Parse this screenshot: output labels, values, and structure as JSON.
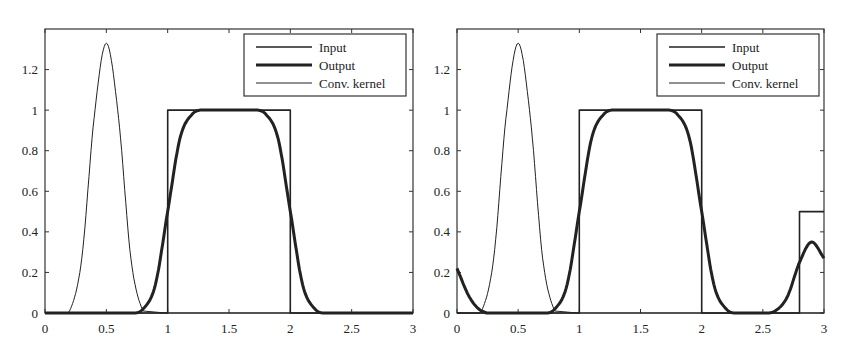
{
  "chart_data": [
    {
      "type": "line",
      "title": "",
      "xlabel": "",
      "ylabel": "",
      "xlim": [
        0,
        3
      ],
      "ylim": [
        0,
        1.4
      ],
      "xticks": [
        "0",
        "0.5",
        "1",
        "1.5",
        "2",
        "2.5",
        "3"
      ],
      "xtick_values": [
        0,
        0.5,
        1,
        1.5,
        2,
        2.5,
        3
      ],
      "yticks": [
        "0",
        "0.2",
        "0.4",
        "0.6",
        "0.8",
        "1",
        "1.2"
      ],
      "ytick_values": [
        0,
        0.2,
        0.4,
        0.6,
        0.8,
        1,
        1.2
      ],
      "grid": false,
      "legend_position": "upper right",
      "series": [
        {
          "name": "Input",
          "style": "medium",
          "description": "rectangular pulse",
          "x": [
            0,
            1,
            1,
            2,
            2,
            3
          ],
          "y": [
            0,
            0,
            1,
            1,
            0,
            0
          ]
        },
        {
          "name": "Output",
          "style": "thick",
          "description": "smoothed pulse (input convolved with kernel)",
          "x": [
            0,
            0.7,
            0.8,
            0.9,
            1.0,
            1.1,
            1.2,
            1.3,
            1.5,
            1.7,
            1.8,
            1.9,
            2.0,
            2.1,
            2.2,
            2.3,
            3
          ],
          "y": [
            0,
            0,
            0.02,
            0.14,
            0.5,
            0.86,
            0.98,
            1.0,
            1.0,
            1.0,
            0.98,
            0.86,
            0.5,
            0.14,
            0.02,
            0,
            0
          ]
        },
        {
          "name": "Conv. kernel",
          "style": "thin",
          "description": "gaussian kernel centered at 0.5",
          "x": [
            0,
            0.2,
            0.3,
            0.4,
            0.5,
            0.6,
            0.7,
            0.8,
            3
          ],
          "y": [
            0,
            0.01,
            0.27,
            0.96,
            1.33,
            0.96,
            0.27,
            0.01,
            0
          ]
        }
      ]
    },
    {
      "type": "line",
      "title": "",
      "xlabel": "",
      "ylabel": "",
      "xlim": [
        0,
        3
      ],
      "ylim": [
        0,
        1.4
      ],
      "xticks": [
        "0",
        "0.5",
        "1",
        "1.5",
        "2",
        "2.5",
        "3"
      ],
      "xtick_values": [
        0,
        0.5,
        1,
        1.5,
        2,
        2.5,
        3
      ],
      "yticks": [
        "0",
        "0.2",
        "0.4",
        "0.6",
        "0.8",
        "1",
        "1.2"
      ],
      "ytick_values": [
        0,
        0.2,
        0.4,
        0.6,
        0.8,
        1,
        1.2
      ],
      "grid": false,
      "legend_position": "upper right",
      "series": [
        {
          "name": "Input",
          "style": "medium",
          "description": "rectangular pulse plus second pulse of height 0.5 from 2.8 to 3",
          "x": [
            0,
            1,
            1,
            2,
            2,
            2.8,
            2.8,
            3
          ],
          "y": [
            0,
            0,
            1,
            1,
            0,
            0,
            0.5,
            0.5
          ]
        },
        {
          "name": "Output",
          "style": "thick",
          "description": "smoothed output with circular wraparound",
          "x": [
            0,
            0.1,
            0.2,
            0.7,
            0.8,
            0.9,
            1.0,
            1.1,
            1.2,
            1.3,
            1.5,
            1.7,
            1.8,
            1.9,
            2.0,
            2.1,
            2.2,
            2.3,
            2.6,
            2.7,
            2.8,
            2.9,
            3.0
          ],
          "y": [
            0.22,
            0.08,
            0.01,
            0,
            0.02,
            0.14,
            0.5,
            0.86,
            0.98,
            1.0,
            1.0,
            1.0,
            0.98,
            0.86,
            0.5,
            0.14,
            0.02,
            0,
            0.01,
            0.08,
            0.25,
            0.35,
            0.27
          ]
        },
        {
          "name": "Conv. kernel",
          "style": "thin",
          "description": "gaussian kernel centered at 0.5",
          "x": [
            0,
            0.2,
            0.3,
            0.4,
            0.5,
            0.6,
            0.7,
            0.8,
            3
          ],
          "y": [
            0,
            0.01,
            0.27,
            0.96,
            1.33,
            0.96,
            0.27,
            0.01,
            0
          ]
        }
      ]
    }
  ],
  "legend": {
    "items": [
      "Input",
      "Output",
      "Conv. kernel"
    ]
  },
  "colors": {
    "line": "#222222",
    "axis": "#333333",
    "background": "#ffffff"
  }
}
